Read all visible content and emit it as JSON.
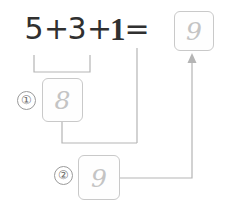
{
  "diagram": {
    "equation": {
      "terms": [
        "5",
        "+",
        "3",
        "+",
        "1",
        "="
      ],
      "addend_1": "5",
      "operator_1": "+",
      "addend_2": "3",
      "operator_2": "+",
      "addend_3": "1",
      "equals": "=",
      "result_value": "9"
    },
    "steps": [
      {
        "marker": "①",
        "value": "8"
      },
      {
        "marker": "②",
        "value": "9"
      }
    ],
    "boxes": {
      "result": "9",
      "step1": "8",
      "step2": "9"
    },
    "colors": {
      "text": "#303030",
      "box_border": "#c9c9c9",
      "box_value": "#c4c4c4",
      "connector": "#b5b5b5",
      "marker_border": "#9a9a9a",
      "marker_text": "#6e6e6e",
      "background": "#ffffff"
    }
  }
}
